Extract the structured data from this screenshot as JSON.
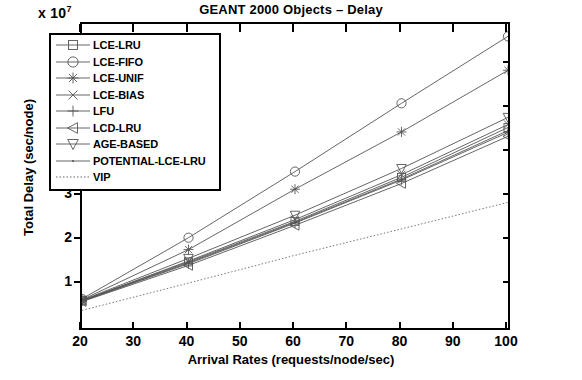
{
  "chart_data": {
    "type": "line",
    "title": "GEANT 2000 Objects – Delay",
    "xlabel": "Arrival Rates (requests/node/sec)",
    "ylabel": "Total Delay (sec/node)",
    "y_multiplier": "x 10",
    "y_multiplier_exp": "7",
    "xlim": [
      20,
      100
    ],
    "ylim": [
      0,
      6.9
    ],
    "xticks": [
      20,
      30,
      40,
      50,
      60,
      70,
      80,
      90,
      100
    ],
    "yticks": [
      1,
      2,
      3,
      4,
      5,
      6
    ],
    "grid": false,
    "legend_position": "upper left",
    "x": [
      20,
      40,
      60,
      80,
      100
    ],
    "series": [
      {
        "name": "LCE-LRU",
        "marker": "square",
        "values": [
          0.62,
          1.5,
          2.42,
          3.42,
          4.55
        ]
      },
      {
        "name": "LCE-FIFO",
        "marker": "circle",
        "values": [
          0.66,
          2.05,
          3.55,
          5.1,
          6.62
        ]
      },
      {
        "name": "LCE-UNIF",
        "marker": "asterisk",
        "values": [
          0.64,
          1.78,
          3.15,
          4.45,
          5.85
        ]
      },
      {
        "name": "LCE-BIAS",
        "marker": "xcross",
        "values": [
          0.62,
          1.52,
          2.46,
          3.48,
          4.62
        ]
      },
      {
        "name": "LFU",
        "marker": "plus",
        "values": [
          0.61,
          1.46,
          2.38,
          3.36,
          4.44
        ]
      },
      {
        "name": "LCD-LRU",
        "marker": "ltri",
        "values": [
          0.6,
          1.42,
          2.33,
          3.28,
          4.35
        ]
      },
      {
        "name": "AGE-BASED",
        "marker": "dtri",
        "values": [
          0.63,
          1.58,
          2.56,
          3.62,
          4.78
        ]
      },
      {
        "name": "POTENTIAL-LCE-LRU",
        "marker": "dot",
        "values": [
          0.61,
          1.48,
          2.4,
          3.38,
          4.48
        ]
      },
      {
        "name": "VIP",
        "marker": "none",
        "values": [
          0.4,
          1.02,
          1.65,
          2.25,
          2.85
        ]
      }
    ]
  }
}
